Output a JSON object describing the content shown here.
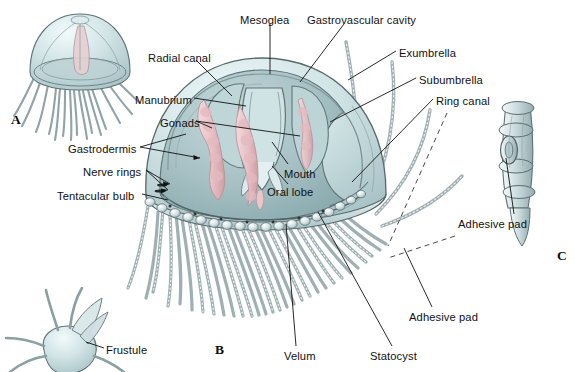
{
  "figure": {
    "background_color": "#ffffff",
    "palette": {
      "bell_outer": "#cfe0e2",
      "bell_inner": "#a9c3c5",
      "bell_shadow": "#8fb0b3",
      "gonad_pink": "#e9c6c9",
      "gonad_pink_dark": "#d4a7ac",
      "tentacle_gray": "#c8d4d6",
      "outline": "#2b3538",
      "leader_line": "#111111",
      "dashed_guide": "#333333"
    }
  },
  "panels": [
    {
      "id": "A",
      "letter": "A",
      "caption": "whole medusa, external view"
    },
    {
      "id": "B",
      "letter": "B",
      "caption": "medusa cut away to show internal structure"
    },
    {
      "id": "C",
      "letter": "C",
      "caption": "enlarged tentacle segment"
    }
  ],
  "labels": [
    {
      "id": "mesoglea",
      "text": "Mesoglea",
      "x": 240,
      "y": 14,
      "anchor": "start"
    },
    {
      "id": "gastrovascular-cavity",
      "text": "Gastrovascular cavity",
      "x": 307,
      "y": 14,
      "anchor": "start"
    },
    {
      "id": "radial-canal",
      "text": "Radial canal",
      "x": 148,
      "y": 52,
      "anchor": "start"
    },
    {
      "id": "exumbrella",
      "text": "Exumbrella",
      "x": 399,
      "y": 47,
      "anchor": "start"
    },
    {
      "id": "subumbrella",
      "text": "Subumbrella",
      "x": 419,
      "y": 74,
      "anchor": "start"
    },
    {
      "id": "ring-canal",
      "text": "Ring canal",
      "x": 436,
      "y": 95,
      "anchor": "start"
    },
    {
      "id": "manubrium",
      "text": "Manubrium",
      "x": 135,
      "y": 94,
      "anchor": "start"
    },
    {
      "id": "gonads",
      "text": "Gonads",
      "x": 160,
      "y": 117,
      "anchor": "start"
    },
    {
      "id": "gastrodermis",
      "text": "Gastrodermis",
      "x": 68,
      "y": 143,
      "anchor": "start"
    },
    {
      "id": "nerve-rings",
      "text": "Nerve rings",
      "x": 83,
      "y": 166,
      "anchor": "start"
    },
    {
      "id": "tentacular-bulb",
      "text": "Tentacular bulb",
      "x": 57,
      "y": 190,
      "anchor": "start"
    },
    {
      "id": "mouth",
      "text": "Mouth",
      "x": 284,
      "y": 168,
      "anchor": "start"
    },
    {
      "id": "oral-lobe",
      "text": "Oral lobe",
      "x": 267,
      "y": 186,
      "anchor": "start"
    },
    {
      "id": "adhesive-pad-c",
      "text": "Adhesive pad",
      "x": 458,
      "y": 218,
      "anchor": "start"
    },
    {
      "id": "adhesive-pad-b",
      "text": "Adhesive pad",
      "x": 409,
      "y": 311,
      "anchor": "start"
    },
    {
      "id": "statocyst",
      "text": "Statocyst",
      "x": 370,
      "y": 350,
      "anchor": "start"
    },
    {
      "id": "velum",
      "text": "Velum",
      "x": 284,
      "y": 350,
      "anchor": "start"
    },
    {
      "id": "frustule",
      "text": "Frustule",
      "x": 106,
      "y": 344,
      "anchor": "start"
    }
  ],
  "panel_letters": [
    {
      "id": "letter-a",
      "text": "A",
      "x": 11,
      "y": 112
    },
    {
      "id": "letter-b",
      "text": "B",
      "x": 215,
      "y": 342
    },
    {
      "id": "letter-c",
      "text": "C",
      "x": 557,
      "y": 248
    }
  ]
}
